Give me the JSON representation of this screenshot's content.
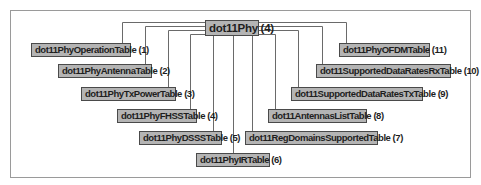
{
  "diagram": {
    "type": "tree",
    "root": {
      "label": "dot11Phy (4)"
    },
    "left_children": [
      {
        "label": "dot11PhyOperationTable (1)"
      },
      {
        "label": "dot11PhyAntennaTable (2)"
      },
      {
        "label": "dot11PhyTxPowerTable (3)"
      },
      {
        "label": "dot11PhyFHSSTable (4)"
      },
      {
        "label": "dot11PhyDSSSTable (5)"
      },
      {
        "label": "dot11PhyIRTable (6)"
      }
    ],
    "right_children": [
      {
        "label": "dot11RegDomainsSupportedTable (7)"
      },
      {
        "label": "dot11AntennasListTable (8)"
      },
      {
        "label": "dot11SupportedDataRatesTxTable (9)"
      },
      {
        "label": "dot11SupportedDataRatesRxTable (10)"
      },
      {
        "label": "dot11PhyOFDMTable (11)"
      }
    ],
    "colors": {
      "node_fill": "#b4b4b4",
      "node_border": "#4a4a4a",
      "line": "#6a6a6a",
      "frame": "#9a9a9a"
    }
  }
}
